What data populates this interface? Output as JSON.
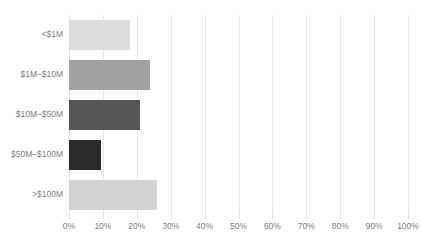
{
  "chart_data": {
    "type": "bar",
    "orientation": "horizontal",
    "title": "",
    "xlabel": "",
    "ylabel": "",
    "categories": [
      "<$1M",
      "$1M–$10M",
      "$10M–$50M",
      "$50M–$100M",
      ">$100M"
    ],
    "values": [
      18,
      24,
      21,
      9.5,
      26
    ],
    "value_unit": "%",
    "xlim": [
      0,
      100
    ],
    "xticks": [
      0,
      10,
      20,
      30,
      40,
      50,
      60,
      70,
      80,
      90,
      100
    ],
    "xticklabels": [
      "0%",
      "10%",
      "20%",
      "30%",
      "40%",
      "50%",
      "60%",
      "70%",
      "80%",
      "90%",
      "100%"
    ],
    "grid": true,
    "grid_axis": "x",
    "legend": false,
    "bar_colors": [
      "#dcdcdc",
      "#a0a0a0",
      "#555555",
      "#2b2b2b",
      "#d2d2d2"
    ],
    "series": [
      {
        "name": "Share of respondents",
        "values": [
          18,
          24,
          21,
          9.5,
          26
        ]
      }
    ]
  },
  "axis": {
    "gridline_color": "#e8e8e8",
    "tick_label_color": "#808080",
    "category_label_color": "#808080"
  }
}
